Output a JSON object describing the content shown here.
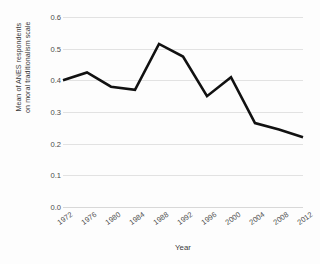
{
  "chart_data": {
    "type": "line",
    "title": "",
    "xlabel": "Year",
    "ylabel": "Mean of ANES respondents on moral traditionalism scale",
    "ylabel_lines": [
      "Mean of ANES respondents",
      "on moral traditionalism scale"
    ],
    "categories": [
      "1972",
      "1976",
      "1980",
      "1984",
      "1988",
      "1992",
      "1996",
      "2000",
      "2004",
      "2008",
      "2012"
    ],
    "values": [
      0.4,
      0.425,
      0.38,
      0.37,
      0.515,
      0.475,
      0.35,
      0.41,
      0.265,
      0.245,
      0.22
    ],
    "series": [
      {
        "name": "Mean moral traditionalism",
        "values": [
          0.4,
          0.425,
          0.38,
          0.37,
          0.515,
          0.475,
          0.35,
          0.41,
          0.265,
          0.245,
          0.22
        ]
      }
    ],
    "ylim": [
      0.0,
      0.6
    ],
    "yticks": [
      "0.0",
      "0.1",
      "0.2",
      "0.3",
      "0.4",
      "0.5",
      "0.6"
    ],
    "ytick_values": [
      0.0,
      0.1,
      0.2,
      0.3,
      0.4,
      0.5,
      0.6
    ],
    "grid": true,
    "legend": "none",
    "line_color": "#111111",
    "grid_color": "#e2e2e2",
    "background_color": "#fdfdfd",
    "text_color": "#4a4a4a"
  }
}
